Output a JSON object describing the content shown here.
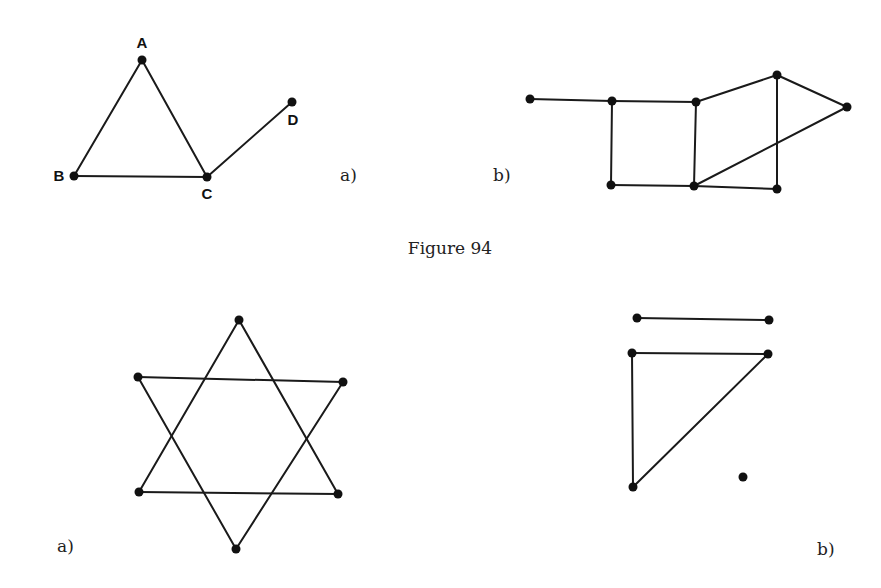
{
  "caption": "Figure 94",
  "graphs": [
    {
      "id": "top-a",
      "label": "a)",
      "label_pos": [
        340,
        181
      ],
      "nodes": [
        {
          "name": "A",
          "x": 142,
          "y": 60,
          "lx": 142,
          "ly": 48
        },
        {
          "name": "B",
          "x": 74,
          "y": 176,
          "lx": 59,
          "ly": 181
        },
        {
          "name": "C",
          "x": 207,
          "y": 177,
          "lx": 207,
          "ly": 199
        },
        {
          "name": "D",
          "x": 292,
          "y": 102,
          "lx": 293,
          "ly": 125
        }
      ],
      "edges": [
        [
          "A",
          "B"
        ],
        [
          "A",
          "C"
        ],
        [
          "B",
          "C"
        ],
        [
          "C",
          "D"
        ]
      ]
    },
    {
      "id": "top-b",
      "label": "b)",
      "label_pos": [
        493,
        181
      ],
      "nodes": [
        {
          "name": "1",
          "x": 530,
          "y": 99
        },
        {
          "name": "2",
          "x": 612,
          "y": 101
        },
        {
          "name": "3",
          "x": 696,
          "y": 102
        },
        {
          "name": "4",
          "x": 777,
          "y": 75
        },
        {
          "name": "5",
          "x": 847,
          "y": 107
        },
        {
          "name": "6",
          "x": 611,
          "y": 185
        },
        {
          "name": "7",
          "x": 694,
          "y": 186
        },
        {
          "name": "8",
          "x": 777,
          "y": 189
        }
      ],
      "edges": [
        [
          "1",
          "2"
        ],
        [
          "2",
          "3"
        ],
        [
          "3",
          "4"
        ],
        [
          "4",
          "5"
        ],
        [
          "2",
          "6"
        ],
        [
          "3",
          "7"
        ],
        [
          "6",
          "7"
        ],
        [
          "7",
          "8"
        ],
        [
          "4",
          "8"
        ],
        [
          "7",
          "5"
        ]
      ]
    },
    {
      "id": "bottom-a",
      "label": "a)",
      "label_pos": [
        57,
        552
      ],
      "nodes": [
        {
          "name": "T",
          "x": 239,
          "y": 320
        },
        {
          "name": "UL",
          "x": 138,
          "y": 377
        },
        {
          "name": "UR",
          "x": 343,
          "y": 382
        },
        {
          "name": "LL",
          "x": 139,
          "y": 492
        },
        {
          "name": "LR",
          "x": 338,
          "y": 494
        },
        {
          "name": "Bo",
          "x": 236,
          "y": 549
        }
      ],
      "edges": [
        [
          "T",
          "LL"
        ],
        [
          "T",
          "LR"
        ],
        [
          "LL",
          "LR"
        ],
        [
          "UL",
          "UR"
        ],
        [
          "UL",
          "Bo"
        ],
        [
          "UR",
          "Bo"
        ]
      ]
    },
    {
      "id": "bottom-b",
      "label": "b)",
      "label_pos": [
        817,
        555
      ],
      "nodes": [
        {
          "name": "P1",
          "x": 637,
          "y": 318
        },
        {
          "name": "P2",
          "x": 769,
          "y": 320
        },
        {
          "name": "Q1",
          "x": 632,
          "y": 353
        },
        {
          "name": "Q2",
          "x": 768,
          "y": 354
        },
        {
          "name": "Q3",
          "x": 633,
          "y": 487
        },
        {
          "name": "Iso",
          "x": 743,
          "y": 477
        }
      ],
      "edges": [
        [
          "P1",
          "P2"
        ],
        [
          "Q1",
          "Q2"
        ],
        [
          "Q1",
          "Q3"
        ],
        [
          "Q2",
          "Q3"
        ]
      ]
    }
  ],
  "caption_pos": [
    450,
    254
  ],
  "colors": {
    "ink": "#111111",
    "background": "#ffffff"
  }
}
